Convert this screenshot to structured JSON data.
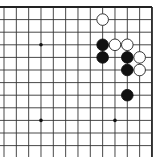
{
  "diagram": {
    "type": "go-board-fragment",
    "view": "top-right corner",
    "grid": {
      "columns": 13,
      "rows": 12,
      "origin_x": 4,
      "origin_y": 7,
      "spacing_x": 12.33,
      "spacing_y": 12.6,
      "top_edge": true,
      "right_edge": true,
      "line_color": "#333333",
      "edge_color": "#222222"
    },
    "star_points": [
      {
        "col": 3,
        "row": 3
      },
      {
        "col": 3,
        "row": 9
      },
      {
        "col": 9,
        "row": 9
      }
    ],
    "stones": [
      {
        "color": "white",
        "col": 8,
        "row": 1
      },
      {
        "color": "black",
        "col": 8,
        "row": 3
      },
      {
        "color": "white",
        "col": 9,
        "row": 3
      },
      {
        "color": "white",
        "col": 10,
        "row": 3
      },
      {
        "color": "black",
        "col": 8,
        "row": 4
      },
      {
        "color": "black",
        "col": 10,
        "row": 4
      },
      {
        "color": "white",
        "col": 11,
        "row": 4
      },
      {
        "color": "black",
        "col": 10,
        "row": 5
      },
      {
        "color": "white",
        "col": 11,
        "row": 5
      },
      {
        "color": "black",
        "col": 10,
        "row": 7
      }
    ],
    "colors": {
      "black_stone": "#111111",
      "white_stone": "#ffffff",
      "white_stone_outline": "#222222",
      "background": "#ffffff"
    }
  }
}
